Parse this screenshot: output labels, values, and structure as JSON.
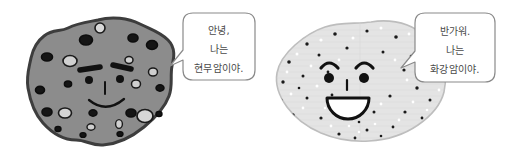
{
  "canvas": {
    "width": 518,
    "height": 162,
    "background": "#ffffff"
  },
  "characters": [
    {
      "id": "basalt",
      "name": "basalt-rock-character",
      "rock_type_label": "현무암",
      "body_color": "#8c8c8c",
      "outline_color": "#3d3d3d",
      "hole_dark_color": "#111111",
      "hole_light_color": "#d8d8d8",
      "face_color": "#111111",
      "speech": {
        "line1": "안녕,",
        "line2": "나는",
        "line3": "현무암이야.",
        "bubble_fill": "#ffffff",
        "bubble_stroke": "#8a8a8a",
        "text_color": "#4a4a4a"
      }
    },
    {
      "id": "granite",
      "name": "granite-rock-character",
      "rock_type_label": "화강암",
      "body_color": "#e2e2e2",
      "outline_color": "#b8b8b8",
      "speck_dark_color": "#1a1a1a",
      "speck_light_color": "#ffffff",
      "face_color": "#111111",
      "speech": {
        "line1": "반가워.",
        "line2": "나는",
        "line3": "화강암이야.",
        "bubble_fill": "#ffffff",
        "bubble_stroke": "#8a8a8a",
        "text_color": "#4a4a4a"
      }
    }
  ]
}
